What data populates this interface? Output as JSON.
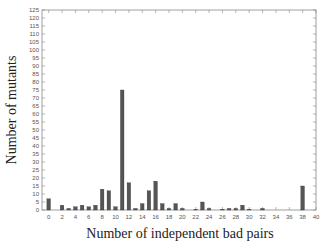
{
  "chart_data": {
    "type": "bar",
    "title": "",
    "xlabel": "Number of independent bad pairs",
    "ylabel": "Number of mutants",
    "xlim": [
      -1,
      40
    ],
    "ylim": [
      0,
      125
    ],
    "xticks": [
      0,
      2,
      4,
      6,
      8,
      10,
      12,
      14,
      16,
      18,
      20,
      22,
      24,
      26,
      28,
      30,
      32,
      34,
      36,
      38,
      40
    ],
    "yticks": [
      0,
      5,
      10,
      15,
      20,
      25,
      30,
      35,
      40,
      45,
      50,
      55,
      60,
      65,
      70,
      75,
      80,
      85,
      90,
      95,
      100,
      105,
      110,
      115,
      120,
      125
    ],
    "x": [
      0,
      1,
      2,
      3,
      4,
      5,
      6,
      7,
      8,
      9,
      10,
      11,
      12,
      13,
      14,
      15,
      16,
      17,
      18,
      19,
      20,
      21,
      22,
      23,
      24,
      25,
      26,
      27,
      28,
      29,
      30,
      31,
      32,
      33,
      34,
      35,
      36,
      37,
      38
    ],
    "values": [
      7,
      0,
      3,
      1,
      2,
      3,
      2,
      3,
      13,
      12,
      2,
      75,
      17,
      1,
      4,
      12,
      18,
      4,
      1,
      4,
      1,
      0,
      0.5,
      5,
      1,
      0,
      0.5,
      1,
      1,
      3,
      0.5,
      0,
      1,
      0,
      0,
      0,
      0,
      0,
      15
    ],
    "bar_color": "#555555",
    "grid": false,
    "legend": null
  }
}
